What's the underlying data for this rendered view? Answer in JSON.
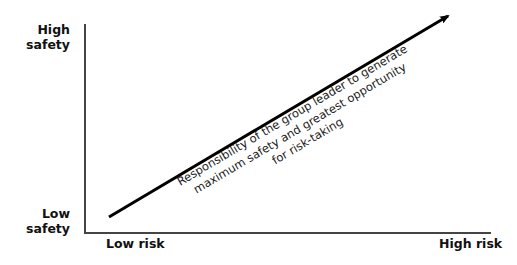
{
  "diagram": {
    "y_axis": {
      "top_label": "High\nsafety",
      "top_label_lines": [
        "High",
        "safety"
      ],
      "bottom_label_lines": [
        "Low",
        "safety"
      ]
    },
    "x_axis": {
      "left_label": "Low risk",
      "right_label": "High risk"
    },
    "arrow": {
      "direction": "up-right",
      "annotation_lines": [
        "Responsibility of the group leader to generate",
        "maximum safety and greatest opportunity",
        "for risk-taking"
      ]
    },
    "colors": {
      "axis": "#444444",
      "arrow": "#000000",
      "text": "#111111"
    }
  }
}
